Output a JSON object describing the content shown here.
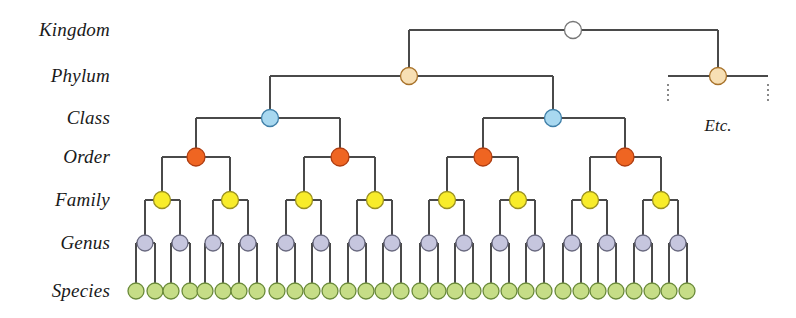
{
  "diagram": {
    "type": "tree",
    "width": 796,
    "height": 318,
    "background": "#ffffff",
    "edge_color": "#4a4a4a",
    "edge_width": 1.1
  },
  "ranks": [
    {
      "label": "Kingdom",
      "y": 30,
      "node_count": 1,
      "fill": "#ffffff",
      "stroke": "#777777",
      "radius": 8.5
    },
    {
      "label": "Phylum",
      "y": 76,
      "node_count": 2,
      "fill": "#f7dfb4",
      "stroke": "#a8722a",
      "radius": 8.5
    },
    {
      "label": "Class",
      "y": 118,
      "node_count": 2,
      "fill": "#a8d8f0",
      "stroke": "#3f7fa8",
      "radius": 8.5
    },
    {
      "label": "Order",
      "y": 157,
      "node_count": 4,
      "fill": "#ef6522",
      "stroke": "#b03d10",
      "radius": 9.0
    },
    {
      "label": "Family",
      "y": 200,
      "node_count": 8,
      "fill": "#f8ec2a",
      "stroke": "#9a9020",
      "radius": 8.5
    },
    {
      "label": "Genus",
      "y": 243,
      "node_count": 16,
      "fill": "#c6c6de",
      "stroke": "#6a6a80",
      "radius": 8.0
    },
    {
      "label": "Species",
      "y": 291,
      "node_count": 32,
      "fill": "#c6dd87",
      "stroke": "#6a8a3a",
      "radius": 8.0
    }
  ],
  "labels": {
    "column_right_edge": 110,
    "entries": [
      {
        "text": "Kingdom",
        "y": 30
      },
      {
        "text": "Phylum",
        "y": 76
      },
      {
        "text": "Class",
        "y": 118
      },
      {
        "text": "Order",
        "y": 157
      },
      {
        "text": "Family",
        "y": 200
      },
      {
        "text": "Genus",
        "y": 243
      },
      {
        "text": "Species",
        "y": 291
      }
    ]
  },
  "main_tree": {
    "root": {
      "x": 573,
      "y": 30,
      "rank": "Kingdom"
    },
    "phylum": [
      {
        "x": 409,
        "y": 76
      }
    ],
    "class": [
      {
        "x": 270,
        "y": 118
      },
      {
        "x": 553,
        "y": 118
      }
    ],
    "order": [
      {
        "x": 196,
        "y": 157
      },
      {
        "x": 340,
        "y": 157
      },
      {
        "x": 483,
        "y": 157
      },
      {
        "x": 625,
        "y": 157
      }
    ],
    "family_x": [
      162,
      230,
      304,
      375,
      447,
      518,
      590,
      661
    ],
    "genus_x": [
      145,
      180,
      213,
      248,
      286,
      321,
      357,
      392,
      429,
      464,
      500,
      535,
      572,
      607,
      643,
      678
    ],
    "species_x": [
      136,
      155,
      171,
      190,
      205,
      223,
      239,
      257,
      277,
      295,
      312,
      330,
      348,
      366,
      383,
      401,
      420,
      438,
      455,
      473,
      491,
      509,
      526,
      544,
      563,
      581,
      598,
      616,
      634,
      652,
      669,
      687
    ]
  },
  "etc_branch": {
    "phylum_node": {
      "x": 718,
      "y": 76
    },
    "bar_left_x": 668,
    "bar_right_x": 768,
    "dotted_top_y": 84,
    "dotted_bottom_y": 104,
    "dot_color": "#4a4a4a",
    "label": {
      "text": "Etc.",
      "x": 718,
      "y": 126
    }
  }
}
